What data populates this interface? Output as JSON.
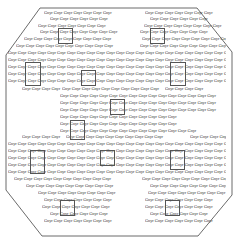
{
  "diagram": {
    "shape": "octagon",
    "stroke_color": "#444444",
    "placeholder_word": "Gnyr",
    "rows": [
      {
        "x": 44,
        "y": 10,
        "count": 7
      },
      {
        "x": 145,
        "y": 10,
        "count": 7
      },
      {
        "x": 50,
        "y": 16,
        "count": 6
      },
      {
        "x": 150,
        "y": 16,
        "count": 6
      },
      {
        "x": 38,
        "y": 23,
        "count": 7
      },
      {
        "x": 144,
        "y": 23,
        "count": 8
      },
      {
        "x": 40,
        "y": 29,
        "count": 8
      },
      {
        "x": 140,
        "y": 29,
        "count": 7
      },
      {
        "x": 24,
        "y": 36,
        "count": 9
      },
      {
        "x": 142,
        "y": 36,
        "count": 9
      },
      {
        "x": 16,
        "y": 43,
        "count": 10
      },
      {
        "x": 140,
        "y": 43,
        "count": 10
      },
      {
        "x": 8,
        "y": 50,
        "count": 28
      },
      {
        "x": 8,
        "y": 57,
        "count": 28
      },
      {
        "x": 8,
        "y": 64,
        "count": 28
      },
      {
        "x": 8,
        "y": 71,
        "count": 28
      },
      {
        "x": 8,
        "y": 78,
        "count": 28
      },
      {
        "x": 22,
        "y": 86,
        "count": 4
      },
      {
        "x": 62,
        "y": 86,
        "count": 10
      },
      {
        "x": 165,
        "y": 86,
        "count": 4
      },
      {
        "x": 60,
        "y": 93,
        "count": 16
      },
      {
        "x": 60,
        "y": 100,
        "count": 16
      },
      {
        "x": 60,
        "y": 107,
        "count": 16
      },
      {
        "x": 60,
        "y": 114,
        "count": 12
      },
      {
        "x": 60,
        "y": 121,
        "count": 12
      },
      {
        "x": 60,
        "y": 128,
        "count": 14
      },
      {
        "x": 22,
        "y": 134,
        "count": 4
      },
      {
        "x": 66,
        "y": 134,
        "count": 10
      },
      {
        "x": 190,
        "y": 134,
        "count": 4
      },
      {
        "x": 8,
        "y": 141,
        "count": 28
      },
      {
        "x": 8,
        "y": 148,
        "count": 28
      },
      {
        "x": 8,
        "y": 155,
        "count": 28
      },
      {
        "x": 8,
        "y": 162,
        "count": 28
      },
      {
        "x": 8,
        "y": 169,
        "count": 28
      },
      {
        "x": 14,
        "y": 176,
        "count": 10
      },
      {
        "x": 142,
        "y": 176,
        "count": 10
      },
      {
        "x": 26,
        "y": 183,
        "count": 9
      },
      {
        "x": 150,
        "y": 183,
        "count": 9
      },
      {
        "x": 38,
        "y": 190,
        "count": 8
      },
      {
        "x": 148,
        "y": 190,
        "count": 8
      },
      {
        "x": 44,
        "y": 197,
        "count": 7
      },
      {
        "x": 145,
        "y": 197,
        "count": 7
      },
      {
        "x": 42,
        "y": 204,
        "count": 7
      },
      {
        "x": 145,
        "y": 204,
        "count": 7
      },
      {
        "x": 50,
        "y": 211,
        "count": 6
      },
      {
        "x": 150,
        "y": 211,
        "count": 6
      },
      {
        "x": 44,
        "y": 218,
        "count": 7
      },
      {
        "x": 145,
        "y": 218,
        "count": 7
      }
    ],
    "boxes": [
      {
        "x": 58,
        "y": 28,
        "w": 13,
        "h": 14
      },
      {
        "x": 150,
        "y": 28,
        "w": 13,
        "h": 14
      },
      {
        "x": 25,
        "y": 62,
        "w": 14,
        "h": 22
      },
      {
        "x": 81,
        "y": 70,
        "w": 13,
        "h": 14
      },
      {
        "x": 170,
        "y": 62,
        "w": 14,
        "h": 22
      },
      {
        "x": 110,
        "y": 99,
        "w": 13,
        "h": 14
      },
      {
        "x": 70,
        "y": 120,
        "w": 13,
        "h": 18
      },
      {
        "x": 30,
        "y": 150,
        "w": 13,
        "h": 22
      },
      {
        "x": 100,
        "y": 150,
        "w": 13,
        "h": 14
      },
      {
        "x": 170,
        "y": 150,
        "w": 13,
        "h": 18
      },
      {
        "x": 60,
        "y": 200,
        "w": 13,
        "h": 14
      },
      {
        "x": 165,
        "y": 200,
        "w": 13,
        "h": 14
      }
    ]
  }
}
